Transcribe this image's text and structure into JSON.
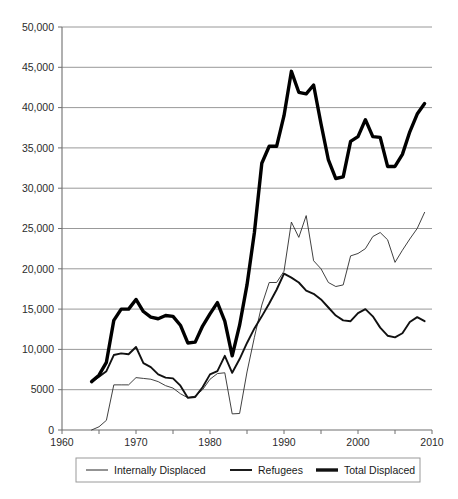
{
  "chart_data": {
    "type": "line",
    "title": "",
    "xlabel": "",
    "ylabel": "",
    "xlim": [
      1960,
      2010
    ],
    "ylim": [
      0,
      50000
    ],
    "grid": true,
    "legend_position": "bottom",
    "y_ticks": [
      0,
      5000,
      10000,
      15000,
      20000,
      25000,
      30000,
      35000,
      40000,
      45000,
      50000
    ],
    "y_tick_labels": [
      "0",
      "5000",
      "10,000",
      "15,000",
      "20,000",
      "25,000",
      "30,000",
      "35,000",
      "40,000",
      "45,000",
      "50,000"
    ],
    "x_ticks": [
      1960,
      1965,
      1970,
      1975,
      1980,
      1985,
      1990,
      1995,
      2000,
      2005,
      2010
    ],
    "x_tick_labels": [
      "1960",
      "",
      "1970",
      "",
      "1980",
      "",
      "1990",
      "",
      "2000",
      "",
      "2010"
    ],
    "x": [
      1964,
      1965,
      1966,
      1967,
      1968,
      1969,
      1970,
      1971,
      1972,
      1973,
      1974,
      1975,
      1976,
      1977,
      1978,
      1979,
      1980,
      1981,
      1982,
      1983,
      1984,
      1985,
      1986,
      1987,
      1988,
      1989,
      1990,
      1991,
      1992,
      1993,
      1994,
      1995,
      1996,
      1997,
      1998,
      1999,
      2000,
      2001,
      2002,
      2003,
      2004,
      2005,
      2006,
      2007,
      2008,
      2009
    ],
    "series": [
      {
        "name": "Internally Displaced",
        "style": "thin",
        "values": [
          0,
          400,
          1200,
          5600,
          5600,
          5600,
          6500,
          6400,
          6300,
          6000,
          5500,
          5200,
          4500,
          4000,
          4200,
          5000,
          6300,
          7000,
          7100,
          2000,
          2050,
          7200,
          11500,
          15500,
          18300,
          18300,
          19700,
          25800,
          23900,
          26600,
          21000,
          20000,
          18300,
          17800,
          18000,
          21600,
          21900,
          22500,
          24000,
          24500,
          23600,
          20800,
          22300,
          23700,
          25000,
          27000
        ]
      },
      {
        "name": "Refugees",
        "style": "medium",
        "values": [
          6000,
          6600,
          7300,
          9300,
          9500,
          9400,
          10300,
          8300,
          7800,
          6900,
          6500,
          6400,
          5500,
          4000,
          4100,
          5300,
          6900,
          7300,
          9200,
          7100,
          8800,
          10800,
          12600,
          14100,
          15700,
          17400,
          19400,
          18900,
          18300,
          17300,
          16900,
          16200,
          15200,
          14200,
          13600,
          13500,
          14500,
          15000,
          14100,
          12700,
          11700,
          11500,
          12000,
          13400,
          14000,
          13500
        ]
      },
      {
        "name": "Total Displaced",
        "style": "thick",
        "values": [
          6000,
          6800,
          8400,
          13600,
          15000,
          15000,
          16200,
          14700,
          14000,
          13800,
          14200,
          14100,
          13000,
          10800,
          10900,
          12900,
          14400,
          15800,
          13500,
          9200,
          13000,
          18000,
          24500,
          33100,
          35200,
          35200,
          39000,
          44500,
          41900,
          41700,
          42800,
          38000,
          33500,
          31200,
          31400,
          35800,
          36400,
          38500,
          36400,
          36300,
          32700,
          32700,
          34200,
          37000,
          39200,
          40500
        ]
      }
    ]
  },
  "legend": {
    "items": [
      {
        "label": "Internally Displaced",
        "style": "thin"
      },
      {
        "label": "Refugees",
        "style": "medium"
      },
      {
        "label": "Total Displaced",
        "style": "thick"
      }
    ]
  }
}
